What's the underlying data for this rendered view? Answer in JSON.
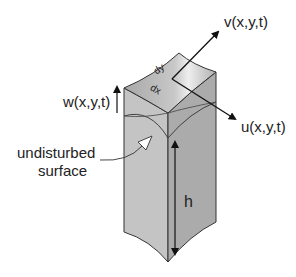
{
  "diagram": {
    "labels": {
      "v": "v(x,y,t)",
      "u": "u(x,y,t)",
      "w": "w(x,y,t)",
      "dy": "dy",
      "dx": "dx",
      "undisturbed_line1": "undisturbed",
      "undisturbed_line2": "surface",
      "h": "h"
    },
    "colors": {
      "face_top": "#b8b8b8",
      "face_left": "#c4c4c4",
      "face_right": "#a9a9a9",
      "edge": "#333333",
      "arrow": "#111111"
    }
  }
}
